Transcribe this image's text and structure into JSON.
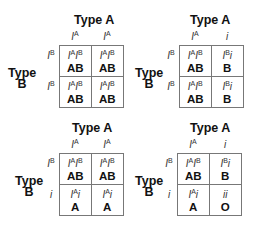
{
  "squares": [
    {
      "title": "Type A",
      "side_label_line1": "Type",
      "side_label_line2": "B",
      "top_alleles": [
        {
          "base": "I",
          "sup": "A"
        },
        {
          "base": "I",
          "sup": "A"
        }
      ],
      "left_alleles": [
        {
          "base": "I",
          "sup": "B"
        },
        {
          "base": "I",
          "sup": "B"
        }
      ],
      "cells": [
        [
          {
            "g1": "I",
            "s1": "A",
            "g2": "I",
            "s2": "B",
            "phenotype": "AB"
          },
          {
            "g1": "I",
            "s1": "A",
            "g2": "I",
            "s2": "B",
            "phenotype": "AB"
          }
        ],
        [
          {
            "g1": "I",
            "s1": "A",
            "g2": "I",
            "s2": "B",
            "phenotype": "AB"
          },
          {
            "g1": "I",
            "s1": "A",
            "g2": "I",
            "s2": "B",
            "phenotype": "AB"
          }
        ]
      ]
    },
    {
      "title": "Type A",
      "side_label_line1": "Type",
      "side_label_line2": "B",
      "top_alleles": [
        {
          "base": "I",
          "sup": "A"
        },
        {
          "base": "i",
          "sup": ""
        }
      ],
      "left_alleles": [
        {
          "base": "I",
          "sup": "B"
        },
        {
          "base": "I",
          "sup": "B"
        }
      ],
      "cells": [
        [
          {
            "g1": "I",
            "s1": "A",
            "g2": "I",
            "s2": "B",
            "phenotype": "AB"
          },
          {
            "g1": "I",
            "s1": "B",
            "g2": "i",
            "s2": "",
            "phenotype": "B"
          }
        ],
        [
          {
            "g1": "I",
            "s1": "A",
            "g2": "I",
            "s2": "B",
            "phenotype": "AB"
          },
          {
            "g1": "I",
            "s1": "B",
            "g2": "i",
            "s2": "",
            "phenotype": "B"
          }
        ]
      ]
    },
    {
      "title": "Type A",
      "side_label_line1": "Type",
      "side_label_line2": "B",
      "top_alleles": [
        {
          "base": "I",
          "sup": "A"
        },
        {
          "base": "I",
          "sup": "A"
        }
      ],
      "left_alleles": [
        {
          "base": "I",
          "sup": "B"
        },
        {
          "base": "i",
          "sup": ""
        }
      ],
      "cells": [
        [
          {
            "g1": "I",
            "s1": "A",
            "g2": "I",
            "s2": "B",
            "phenotype": "AB"
          },
          {
            "g1": "I",
            "s1": "A",
            "g2": "I",
            "s2": "B",
            "phenotype": "AB"
          }
        ],
        [
          {
            "g1": "I",
            "s1": "A",
            "g2": "i",
            "s2": "",
            "phenotype": "A"
          },
          {
            "g1": "I",
            "s1": "A",
            "g2": "i",
            "s2": "",
            "phenotype": "A"
          }
        ]
      ]
    },
    {
      "title": "Type A",
      "side_label_line1": "Type",
      "side_label_line2": "B",
      "top_alleles": [
        {
          "base": "I",
          "sup": "A"
        },
        {
          "base": "i",
          "sup": ""
        }
      ],
      "left_alleles": [
        {
          "base": "I",
          "sup": "B"
        },
        {
          "base": "i",
          "sup": ""
        }
      ],
      "cells": [
        [
          {
            "g1": "I",
            "s1": "A",
            "g2": "I",
            "s2": "B",
            "phenotype": "AB"
          },
          {
            "g1": "I",
            "s1": "B",
            "g2": "i",
            "s2": "",
            "phenotype": "B"
          }
        ],
        [
          {
            "g1": "I",
            "s1": "A",
            "g2": "i",
            "s2": "",
            "phenotype": "A"
          },
          {
            "g1": "i",
            "s1": "",
            "g2": "i",
            "s2": "",
            "phenotype": "O"
          }
        ]
      ]
    }
  ]
}
